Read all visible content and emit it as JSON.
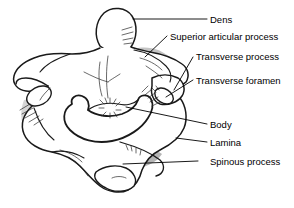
{
  "figure": {
    "background_color": "#ffffff",
    "outline_color": "#1a1a1a",
    "bone_fill_color": "#ffffff",
    "shadow_fill_color": "#b8b8b8",
    "mid_shadow_color": "#d4d4d4",
    "leader_color": "#000000"
  },
  "labels": [
    {
      "id": "dens",
      "text": "Dens",
      "text_x": 210,
      "text_y": 15,
      "leader": {
        "x1": 207,
        "y1": 19,
        "x2": 133,
        "y2": 19
      }
    },
    {
      "id": "superior-articular-process",
      "text": "Superior articular process",
      "text_x": 170,
      "text_y": 32,
      "leader": {
        "x1": 167,
        "y1": 36,
        "x2": 145,
        "y2": 57
      }
    },
    {
      "id": "transverse-process",
      "text": "Transverse process",
      "text_x": 196,
      "text_y": 52,
      "leader": {
        "x1": 193,
        "y1": 57,
        "x2": 174,
        "y2": 90
      }
    },
    {
      "id": "transverse-foramen",
      "text": "Transverse foramen",
      "text_x": 196,
      "text_y": 76,
      "leader": {
        "x1": 193,
        "y1": 80,
        "x2": 166,
        "y2": 97
      }
    },
    {
      "id": "body",
      "text": "Body",
      "text_x": 210,
      "text_y": 120,
      "leader": {
        "x1": 207,
        "y1": 124,
        "x2": 126,
        "y2": 107
      }
    },
    {
      "id": "lamina",
      "text": "Lamina",
      "text_x": 210,
      "text_y": 138,
      "leader": {
        "x1": 207,
        "y1": 142,
        "x2": 176,
        "y2": 138
      }
    },
    {
      "id": "spinous-process",
      "text": "Spinous process",
      "text_x": 210,
      "text_y": 157,
      "leader": {
        "x1": 198,
        "y1": 161,
        "x2": 123,
        "y2": 164
      }
    }
  ]
}
